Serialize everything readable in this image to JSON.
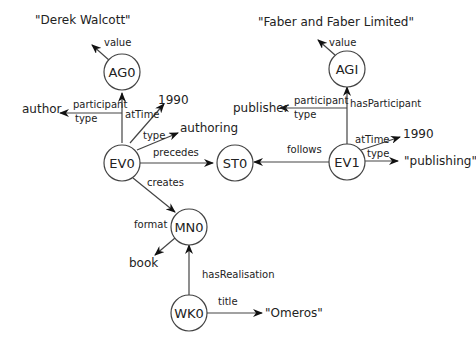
{
  "diagram": {
    "nodes": {
      "AG0": "AG0",
      "AGI": "AGI",
      "EV0": "EV0",
      "EV1": "EV1",
      "ST0": "ST0",
      "MN0": "MN0",
      "WK0": "WK0"
    },
    "literals": {
      "derek": "\"Derek Walcott\"",
      "faber": "\"Faber and Faber Limited\"",
      "author": "author",
      "publisher": "publisher",
      "year_ev0": "1990",
      "year_ev1": "1990",
      "authoring": "authoring",
      "publishing": "\"publishing\"",
      "book": "book",
      "omeros": "\"Omeros\""
    },
    "edges": {
      "ag0_value": "value",
      "agi_value": "value",
      "ev0_participant": "participant",
      "ev0_participant_type": "type",
      "ev0_attime": "atTime",
      "ev0_type": "type",
      "ev0_precedes": "precedes",
      "ev0_creates": "creates",
      "ev1_participant": "participant",
      "ev1_participant_type": "type",
      "ev1_hasparticipant": "hasParticipant",
      "ev1_follows": "follows",
      "ev1_attime": "atTime",
      "ev1_type": "type",
      "mn0_format": "format",
      "wk0_hasrealisation": "hasRealisation",
      "wk0_title": "title"
    }
  }
}
